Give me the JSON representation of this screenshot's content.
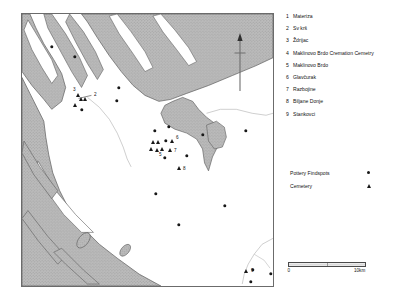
{
  "map": {
    "title_region": "Zadar hinterland distribution map",
    "north_arrow_icon": "north-arrow-icon",
    "land_color": "#b4b4b4",
    "sea_color": "#ffffff",
    "coast_line_color": "#5d5d5d",
    "river_color": "#b9b9b9",
    "frame_color": "#6b6b6b"
  },
  "legend": {
    "items": [
      {
        "num": "1",
        "name": "Materiza"
      },
      {
        "num": "2",
        "name": "Sv krš"
      },
      {
        "num": "3",
        "name": "Ždrijac"
      },
      {
        "num": "4",
        "name": "Maklinovo Brdo Cremation Cemetry"
      },
      {
        "num": "5",
        "name": "Maklinovo Brdo"
      },
      {
        "num": "6",
        "name": "Glavčurak"
      },
      {
        "num": "7",
        "name": "Razbojine"
      },
      {
        "num": "8",
        "name": "Biljane Donje"
      },
      {
        "num": "9",
        "name": "Stankovci"
      }
    ]
  },
  "symbol_key": {
    "rows": [
      {
        "label": "Pottery Findspots",
        "symbol": "dot"
      },
      {
        "label": "Cemetery",
        "symbol": "triangle"
      }
    ]
  },
  "scale": {
    "min_label": "0",
    "max_label": "10km"
  },
  "chart_data": {
    "type": "scatter",
    "title": "",
    "xlabel": "",
    "ylabel": "",
    "markers": [
      {
        "id": "d1",
        "type": "dot",
        "x": 30,
        "y": 33,
        "label": ""
      },
      {
        "id": "d2",
        "type": "dot",
        "x": 53,
        "y": 43,
        "label": ""
      },
      {
        "id": "d3",
        "type": "dot",
        "x": 97,
        "y": 74,
        "label": ""
      },
      {
        "id": "d4",
        "type": "dot",
        "x": 95,
        "y": 87,
        "label": ""
      },
      {
        "id": "t3",
        "type": "triangle",
        "x": 56,
        "y": 81,
        "label": "3",
        "label_dx": -5,
        "label_dy": -5
      },
      {
        "id": "t1",
        "type": "triangle",
        "x": 59,
        "y": 85,
        "label": ""
      },
      {
        "id": "t2",
        "type": "triangle",
        "x": 63,
        "y": 85,
        "label": "2",
        "label_dx": 9,
        "label_dy": -4
      },
      {
        "id": "t4",
        "type": "triangle",
        "x": 53,
        "y": 91,
        "label": ""
      },
      {
        "id": "d5",
        "type": "dot",
        "x": 60,
        "y": 96,
        "label": ""
      },
      {
        "id": "d6",
        "type": "dot",
        "x": 133,
        "y": 117,
        "label": ""
      },
      {
        "id": "d7",
        "type": "dot",
        "x": 147,
        "y": 113,
        "label": ""
      },
      {
        "id": "d8",
        "type": "dot",
        "x": 181,
        "y": 121,
        "label": ""
      },
      {
        "id": "d9",
        "type": "dot",
        "x": 224,
        "y": 117,
        "label": ""
      },
      {
        "id": "t5a",
        "type": "triangle",
        "x": 131,
        "y": 128,
        "label": ""
      },
      {
        "id": "t5b",
        "type": "triangle",
        "x": 136,
        "y": 128,
        "label": ""
      },
      {
        "id": "d10",
        "type": "dot",
        "x": 144,
        "y": 127,
        "label": ""
      },
      {
        "id": "t6",
        "type": "triangle",
        "x": 150,
        "y": 127,
        "label": "6",
        "label_dx": 4,
        "label_dy": -3
      },
      {
        "id": "t7a",
        "type": "triangle",
        "x": 129,
        "y": 135,
        "label": ""
      },
      {
        "id": "t7b",
        "type": "triangle",
        "x": 135,
        "y": 136,
        "label": ""
      },
      {
        "id": "t5c",
        "type": "triangle",
        "x": 140,
        "y": 135,
        "label": "5",
        "label_dx": -3,
        "label_dy": 6
      },
      {
        "id": "t7",
        "type": "triangle",
        "x": 148,
        "y": 136,
        "label": "7",
        "label_dx": 4,
        "label_dy": 1
      },
      {
        "id": "d11",
        "type": "dot",
        "x": 143,
        "y": 144,
        "label": ""
      },
      {
        "id": "d12",
        "type": "dot",
        "x": 165,
        "y": 142,
        "label": ""
      },
      {
        "id": "t8",
        "type": "triangle",
        "x": 157,
        "y": 154,
        "label": "8",
        "label_dx": 4,
        "label_dy": 1
      },
      {
        "id": "d13",
        "type": "dot",
        "x": 134,
        "y": 180,
        "label": ""
      },
      {
        "id": "d14",
        "type": "dot",
        "x": 203,
        "y": 192,
        "label": ""
      },
      {
        "id": "d15",
        "type": "dot",
        "x": 157,
        "y": 211,
        "label": ""
      },
      {
        "id": "t9",
        "type": "triangle",
        "x": 224,
        "y": 257,
        "label": "9",
        "label_dx": 5,
        "label_dy": 0
      },
      {
        "id": "d16",
        "type": "dot",
        "x": 231,
        "y": 256,
        "label": ""
      },
      {
        "id": "d17",
        "type": "dot",
        "x": 249,
        "y": 260,
        "label": ""
      },
      {
        "id": "d18",
        "type": "dot",
        "x": 229,
        "y": 268,
        "label": ""
      }
    ]
  }
}
